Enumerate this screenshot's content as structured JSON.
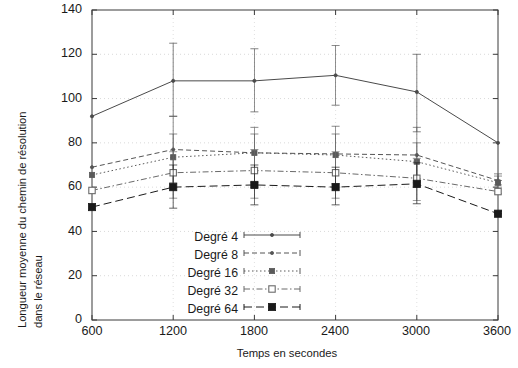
{
  "chart": {
    "type": "line",
    "xlabel": "Temps en secondes",
    "ylabel_line1": "Longueur moyenne du chemin de résolution",
    "ylabel_line2": "dans le réseau",
    "x_ticks": [
      "600",
      "1200",
      "1800",
      "2400",
      "3000",
      "3600"
    ],
    "y_ticks": [
      "0",
      "20",
      "40",
      "60",
      "80",
      "100",
      "120",
      "140"
    ],
    "legend": [
      {
        "label": "Degré 4"
      },
      {
        "label": "Degré 8"
      },
      {
        "label": "Degré 16"
      },
      {
        "label": "Degré 32"
      },
      {
        "label": "Degré 64"
      }
    ]
  },
  "chart_data": {
    "type": "line",
    "title": "",
    "xlabel": "Temps en secondes",
    "ylabel": "Longueur moyenne du chemin de résolution dans le réseau",
    "x": [
      600,
      1200,
      1800,
      2400,
      3000,
      3600
    ],
    "xlim": [
      600,
      3600
    ],
    "ylim": [
      0,
      140
    ],
    "y_tick_step": 20,
    "grid": true,
    "legend_position": "inside-bottom-center",
    "error_bars": true,
    "series": [
      {
        "name": "Degré 4",
        "values": [
          92,
          108,
          108,
          110.5,
          103,
          80
        ],
        "err_low": [
          92,
          92,
          94,
          97,
          85,
          80
        ],
        "err_high": [
          92,
          125,
          122.5,
          124,
          120,
          80
        ],
        "line_style": "solid",
        "marker": "dot-small",
        "color": "#4a4a4a"
      },
      {
        "name": "Degré 8",
        "values": [
          69,
          77,
          75.5,
          75,
          74.5,
          63
        ],
        "err_low": [
          69,
          62,
          62,
          61.5,
          62,
          63
        ],
        "err_high": [
          69,
          92,
          87,
          87.5,
          87,
          66
        ],
        "line_style": "dashed",
        "marker": "dot-small",
        "color": "#555555"
      },
      {
        "name": "Degré 16",
        "values": [
          65.5,
          73.5,
          75.5,
          74.5,
          71.5,
          62
        ],
        "err_low": [
          65.5,
          60,
          60,
          60,
          60,
          61
        ],
        "err_high": [
          65.5,
          84,
          84,
          84,
          80,
          65
        ],
        "line_style": "dotted",
        "marker": "square-small-filled",
        "color": "#5a5a5a"
      },
      {
        "name": "Degré 32",
        "values": [
          58.5,
          66.5,
          67.5,
          66.5,
          64,
          58
        ],
        "err_low": [
          58.5,
          55,
          55,
          55,
          54,
          57
        ],
        "err_high": [
          58.5,
          76,
          77,
          76,
          73,
          60
        ],
        "line_style": "dashdot",
        "marker": "square-open",
        "color": "#6a6a6a"
      },
      {
        "name": "Degré 64",
        "values": [
          51,
          60,
          61,
          60,
          61.5,
          48
        ],
        "err_low": [
          51,
          50.5,
          52,
          52,
          52.5,
          48
        ],
        "err_high": [
          51,
          70,
          70,
          69,
          71,
          49
        ],
        "line_style": "longdash",
        "marker": "square-large-filled",
        "color": "#1a1a1a"
      }
    ]
  }
}
